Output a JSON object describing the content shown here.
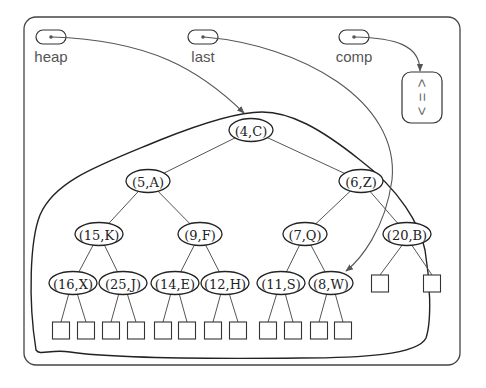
{
  "diagram": {
    "type": "binary-heap",
    "frame": {
      "x": 24,
      "y": 17,
      "width": 436,
      "height": 348,
      "radius": 12
    },
    "pointers": [
      {
        "id": "heap",
        "label": "heap",
        "cx": 50,
        "cy": 37,
        "target": "(4,C)"
      },
      {
        "id": "last",
        "label": "last",
        "cx": 202,
        "cy": 37,
        "target": "(8,W)"
      },
      {
        "id": "comp",
        "label": "comp",
        "cx": 353,
        "cy": 37,
        "target": "comparator"
      }
    ],
    "comparator": {
      "x": 402,
      "y": 72,
      "width": 40,
      "height": 51,
      "symbols": [
        "<",
        "=",
        ">"
      ]
    },
    "nodes": [
      {
        "label": "(4,C)",
        "x": 251,
        "y": 130
      },
      {
        "label": "(5,A)",
        "x": 148,
        "y": 181
      },
      {
        "label": "(6,Z)",
        "x": 361,
        "y": 181
      },
      {
        "label": "(15,K)",
        "x": 99,
        "y": 234
      },
      {
        "label": "(9,F)",
        "x": 200,
        "y": 234
      },
      {
        "label": "(7,Q)",
        "x": 305,
        "y": 234
      },
      {
        "label": "(20,B)",
        "x": 407,
        "y": 234
      },
      {
        "label": "(16,X)",
        "x": 73,
        "y": 283
      },
      {
        "label": "(25,J)",
        "x": 123,
        "y": 283
      },
      {
        "label": "(14,E)",
        "x": 175,
        "y": 283
      },
      {
        "label": "(12,H)",
        "x": 225,
        "y": 283
      },
      {
        "label": "(11,S)",
        "x": 281,
        "y": 283
      },
      {
        "label": "(8,W)",
        "x": 331,
        "y": 283
      }
    ],
    "edges": [
      [
        0,
        1
      ],
      [
        0,
        2
      ],
      [
        1,
        3
      ],
      [
        1,
        4
      ],
      [
        2,
        5
      ],
      [
        2,
        6
      ],
      [
        3,
        7
      ],
      [
        3,
        8
      ],
      [
        4,
        9
      ],
      [
        4,
        10
      ],
      [
        5,
        11
      ],
      [
        5,
        12
      ]
    ],
    "leaves": [
      {
        "parent": 6,
        "x": 380,
        "y": 284
      },
      {
        "parent": 6,
        "x": 432,
        "y": 284
      },
      {
        "parent": 7,
        "x": 61,
        "y": 331
      },
      {
        "parent": 7,
        "x": 86,
        "y": 331
      },
      {
        "parent": 8,
        "x": 111,
        "y": 331
      },
      {
        "parent": 8,
        "x": 136,
        "y": 331
      },
      {
        "parent": 9,
        "x": 163,
        "y": 331
      },
      {
        "parent": 9,
        "x": 187,
        "y": 331
      },
      {
        "parent": 10,
        "x": 213,
        "y": 331
      },
      {
        "parent": 10,
        "x": 238,
        "y": 331
      },
      {
        "parent": 11,
        "x": 268,
        "y": 331
      },
      {
        "parent": 11,
        "x": 293,
        "y": 331
      },
      {
        "parent": 12,
        "x": 319,
        "y": 331
      },
      {
        "parent": 12,
        "x": 343,
        "y": 331
      }
    ],
    "colors": {
      "stroke": "#333333",
      "pointer": "#555555",
      "text": "#222222",
      "label": "#555555"
    }
  }
}
